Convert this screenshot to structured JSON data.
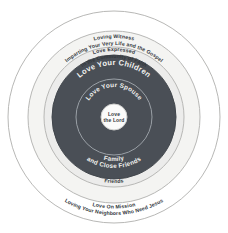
{
  "diagram": {
    "type": "concentric-circles",
    "center": {
      "x": 114,
      "y": 117
    },
    "colors": {
      "background": "#ffffff",
      "outer_ring_fill": "#ffffff",
      "ring_witness_fill": "#f4f4f2",
      "ring_community_fill": "#ececeb",
      "ring_children_fill": "#4a4f56",
      "ring_spouse_fill": "#4a4f56",
      "center_fill": "#fbfbfa",
      "stroke_light": "#b8b8b6",
      "stroke_inner": "#9aa0a6",
      "text_dark": "#33383d",
      "text_light": "#f2f2f0"
    },
    "rings": [
      {
        "id": "love-on-mission",
        "radius": 106,
        "fill": "#ffffff",
        "stroke": "#b8b8b6",
        "text_color": "#33383d",
        "line1": "Love On Mission",
        "line2": "Loving Your Neighbors Who Need Jesus",
        "line1_position": "bottom",
        "line2_position": "bottom"
      },
      {
        "id": "loving-witness",
        "radius": 86,
        "fill": "#f4f4f2",
        "stroke": "#b8b8b6",
        "text_color": "#33383d",
        "line1": "Loving Witness",
        "line2": "Imparting Your Very Life and the Gospel",
        "line1_position": "top",
        "line2_position": "top"
      },
      {
        "id": "love-expressed",
        "radius": 70,
        "fill": "#ececeb",
        "stroke": "#b8b8b6",
        "text_color": "#33383d",
        "line1": "Love Expressed",
        "line2": "In the Community of Faith",
        "line3": "Friends",
        "line1_position": "top",
        "line2_position": "top",
        "line3_position": "bottom"
      },
      {
        "id": "love-your-children",
        "radius": 62,
        "fill": "#4a4f56",
        "stroke": "#4a4f56",
        "text_color": "#f2f2f0",
        "line1": "Love Your Children",
        "line2": "Family",
        "line3": "and Close Friends",
        "line1_position": "top",
        "line2_position": "bottom",
        "line3_position": "bottom"
      },
      {
        "id": "love-your-spouse",
        "radius": 38,
        "fill": "#4a4f56",
        "stroke": "#9aa0a6",
        "text_color": "#f2f2f0",
        "line1": "Love Your Spouse",
        "line1_position": "top"
      },
      {
        "id": "love-the-lord",
        "radius": 13,
        "fill": "#fbfbfa",
        "stroke": "#cfcfcd",
        "text_color": "#33383d",
        "line1": "Love",
        "line2": "the Lord",
        "line1_position": "center",
        "line2_position": "center"
      }
    ],
    "labels": {
      "love_on_mission_1": "Love On Mission",
      "love_on_mission_2": "Loving Your Neighbors Who Need Jesus",
      "loving_witness_1": "Loving Witness",
      "loving_witness_2": "Imparting Your Very Life and the Gospel",
      "love_expressed_1": "Love Expressed",
      "love_expressed_2": "In the Community of Faith",
      "friends": "Friends",
      "love_your_children": "Love Your Children",
      "family_1": "Family",
      "family_2": "and Close Friends",
      "love_your_spouse": "Love Your Spouse",
      "love_the_lord_1": "Love",
      "love_the_lord_2": "the Lord"
    }
  }
}
